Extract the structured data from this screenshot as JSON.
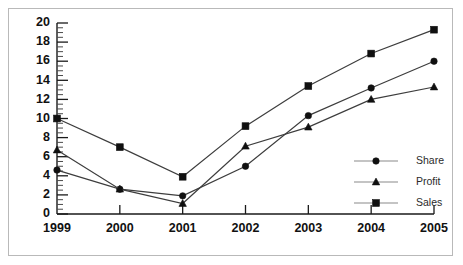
{
  "chart_data": {
    "type": "line",
    "title": "",
    "xlabel": "",
    "ylabel": "",
    "categories": [
      "1999",
      "2000",
      "2001",
      "2002",
      "2003",
      "2004",
      "2005"
    ],
    "ylim": [
      0,
      20
    ],
    "ytick_labels": [
      "0",
      "2",
      "4",
      "6",
      "8",
      "10",
      "12",
      "14",
      "16",
      "18",
      "20"
    ],
    "ytick_step": 2,
    "yminor_step": 0.5,
    "grid": false,
    "legend_position": "right-middle",
    "series": [
      {
        "name": "Share",
        "marker": "circle",
        "values": [
          4.6,
          2.6,
          1.9,
          5.0,
          10.3,
          13.2,
          16.0
        ]
      },
      {
        "name": "Profit",
        "marker": "triangle",
        "values": [
          6.7,
          2.6,
          1.1,
          7.1,
          9.1,
          12.0,
          13.3
        ]
      },
      {
        "name": "Sales",
        "marker": "square",
        "values": [
          10.0,
          7.0,
          3.9,
          9.2,
          13.4,
          16.8,
          19.3
        ]
      }
    ]
  },
  "legend": {
    "items": [
      {
        "label": "Share"
      },
      {
        "label": "Profit"
      },
      {
        "label": "Sales"
      }
    ]
  },
  "colors": {
    "line": "#3d3d3d",
    "marker": "#101010",
    "axis": "#1a1a1a",
    "legend_line": "#8a8a8a",
    "border": "#b9b9b9",
    "background": "#ffffff"
  }
}
